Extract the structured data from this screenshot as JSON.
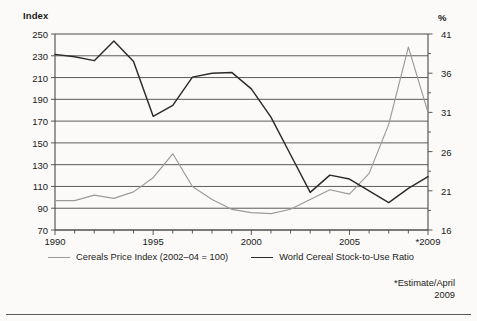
{
  "axis_titles": {
    "left": "Index",
    "right": "%"
  },
  "legend": {
    "items": [
      {
        "label": "Cereals Price Index (2002–04 = 100)",
        "color": "#9a9a9a"
      },
      {
        "label": "World Cereal Stock-to-Use Ratio",
        "color": "#2b2b2b"
      }
    ]
  },
  "footnote": {
    "line1": "*Estimate/April",
    "line2": "2009"
  },
  "chart_data": {
    "type": "line",
    "title": "",
    "xlabel": "",
    "grid": true,
    "legend_position": "bottom",
    "x": [
      1990,
      1991,
      1992,
      1993,
      1994,
      1995,
      1996,
      1997,
      1998,
      1999,
      2000,
      2001,
      2002,
      2003,
      2004,
      2005,
      2006,
      2007,
      2008,
      2009
    ],
    "xtick_labels": [
      "1990",
      "1995",
      "2000",
      "2005",
      "*2009"
    ],
    "xtick_values": [
      1990,
      1995,
      2000,
      2005,
      2009
    ],
    "xlim": [
      1990,
      2009
    ],
    "left_axis": {
      "label": "Index",
      "ylim": [
        70,
        250
      ],
      "ticks": [
        70,
        90,
        110,
        130,
        150,
        170,
        190,
        210,
        230,
        250
      ]
    },
    "right_axis": {
      "label": "%",
      "ylim": [
        16,
        41
      ],
      "ticks": [
        16,
        21,
        26,
        31,
        36,
        41
      ],
      "minor_tick_step": 2.5
    },
    "series": [
      {
        "name": "Cereals Price Index (2002–04 = 100)",
        "axis": "left",
        "units": "index (2002-04 = 100)",
        "color": "#9a9a9a",
        "values": [
          97,
          97,
          102,
          99,
          105,
          118,
          140,
          110,
          98,
          89,
          86,
          85,
          89,
          98,
          107,
          103,
          122,
          167,
          238,
          178
        ]
      },
      {
        "name": "World Cereal Stock-to-Use Ratio",
        "axis": "right",
        "units": "percent",
        "color": "#2b2b2b",
        "values": [
          38.4,
          38.1,
          37.6,
          40.1,
          37.5,
          30.5,
          31.9,
          35.5,
          36.0,
          36.1,
          34.0,
          30.4,
          25.6,
          20.8,
          23.0,
          22.5,
          21.0,
          19.5,
          21.3,
          22.8
        ]
      }
    ]
  }
}
